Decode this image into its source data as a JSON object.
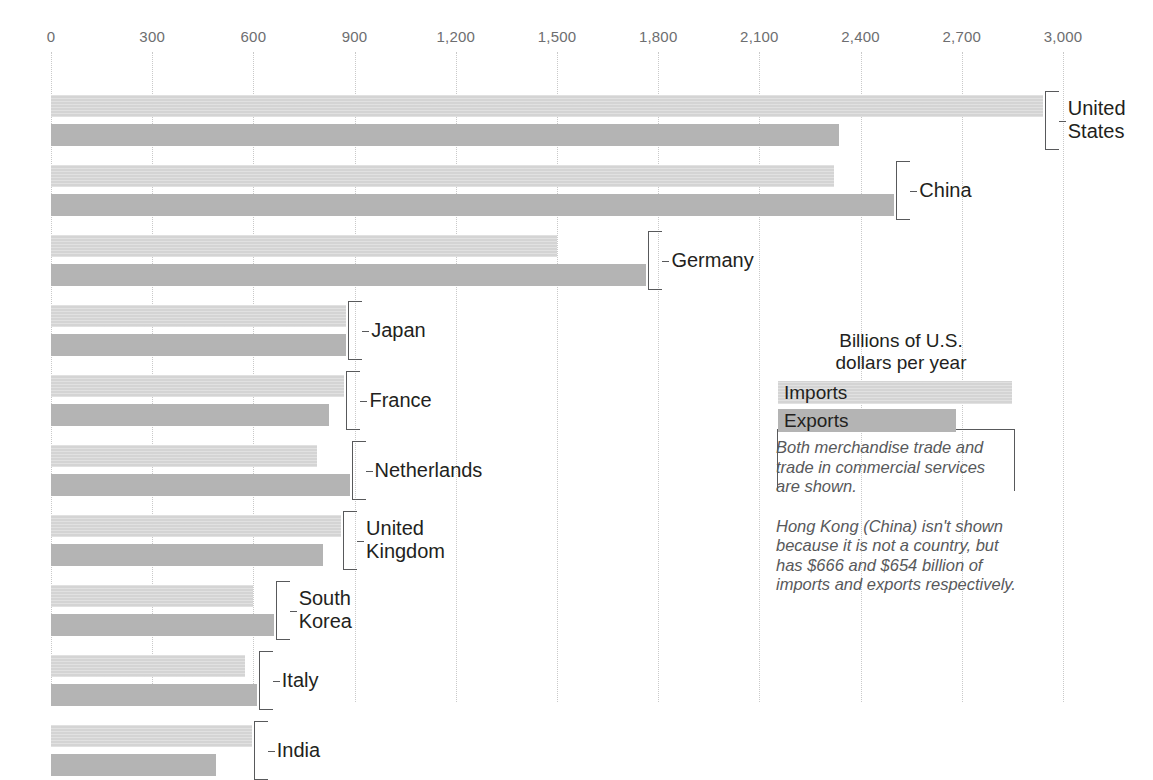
{
  "chart_data": {
    "type": "bar",
    "orientation": "horizontal",
    "title": "",
    "xlabel": "",
    "ylabel": "",
    "xlim": [
      0,
      3000
    ],
    "xticks": [
      0,
      300,
      600,
      900,
      1200,
      1500,
      1800,
      2100,
      2400,
      2700,
      3000
    ],
    "xtick_labels": [
      "0",
      "300",
      "600",
      "900",
      "1,200",
      "1,500",
      "1,800",
      "2,100",
      "2,400",
      "2,700",
      "3,000"
    ],
    "grid": true,
    "grid_style": "dotted-vertical",
    "units": "Billions of U.S. dollars per year",
    "legend_position": "inside-right",
    "categories": [
      "United States",
      "China",
      "Germany",
      "Japan",
      "France",
      "Netherlands",
      "United Kingdom",
      "South Korea",
      "Italy",
      "India"
    ],
    "series": [
      {
        "name": "Imports",
        "color": "#d4d4d4",
        "values": [
          2940,
          2320,
          1500,
          875,
          870,
          790,
          860,
          600,
          575,
          595
        ]
      },
      {
        "name": "Exports",
        "color": "#b4b4b4",
        "values": [
          2335,
          2500,
          1765,
          875,
          825,
          885,
          805,
          660,
          610,
          490
        ]
      }
    ]
  },
  "axis": {
    "tick_labels": [
      "0",
      "300",
      "600",
      "900",
      "1,200",
      "1,500",
      "1,800",
      "2,100",
      "2,400",
      "2,700",
      "3,000"
    ]
  },
  "groups": [
    {
      "label": "United States",
      "imports": 2940,
      "exports": 2335
    },
    {
      "label": "China",
      "imports": 2320,
      "exports": 2500
    },
    {
      "label": "Germany",
      "imports": 1500,
      "exports": 1765
    },
    {
      "label": "Japan",
      "imports": 875,
      "exports": 875
    },
    {
      "label": "France",
      "imports": 870,
      "exports": 825
    },
    {
      "label": "Netherlands",
      "imports": 790,
      "exports": 885
    },
    {
      "label": "United Kingdom",
      "imports": 860,
      "exports": 805
    },
    {
      "label": "South Korea",
      "imports": 600,
      "exports": 660
    },
    {
      "label": "Italy",
      "imports": 575,
      "exports": 610
    },
    {
      "label": "India",
      "imports": 595,
      "exports": 490
    }
  ],
  "legend": {
    "title": "Billions of U.S.\ndollars per year",
    "imports_label": "Imports",
    "exports_label": "Exports",
    "note_1": "Both merchandise trade and\ntrade in commercial services\nare shown.",
    "note_2": "Hong Kong (China) isn't shown\nbecause it is not a country, but\nhas $666 and $654 billion of\nimports and exports respectively."
  },
  "colors": {
    "imports": "#d4d4d4",
    "exports": "#b4b4b4",
    "gridline": "#c9c9c9",
    "tick_text": "#6d6e70",
    "label_text": "#231f20",
    "note_text": "#58595b"
  }
}
